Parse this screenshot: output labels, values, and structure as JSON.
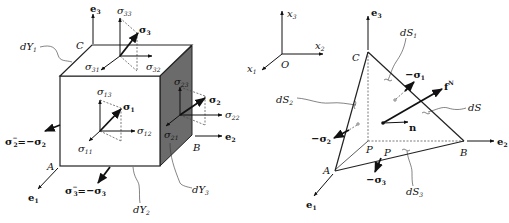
{
  "left_figure": {
    "title": "Stress element cube",
    "vertices": {
      "C": "C",
      "A": "A",
      "B": "B"
    },
    "basis": {
      "e3": "e",
      "e3_sub": "3",
      "e1": "e",
      "e1_sub": "1",
      "e2": "e",
      "e2_sub": "2"
    },
    "surfaces": {
      "dY1": "dY",
      "dY1_sub": "1",
      "dY2": "dY",
      "dY2_sub": "2",
      "dY3": "dY",
      "dY3_sub": "3"
    },
    "top_face": {
      "sigma33": "σ",
      "sigma33_sub": "33",
      "sigma31": "σ",
      "sigma31_sub": "31",
      "sigma32": "σ",
      "sigma32_sub": "32",
      "vec": "σ",
      "vec_sub": "3"
    },
    "front_face": {
      "sigma13": "σ",
      "sigma13_sub": "13",
      "sigma11": "σ",
      "sigma11_sub": "11",
      "sigma12": "σ",
      "sigma12_sub": "12",
      "vec": "σ",
      "vec_sub": "1"
    },
    "side_face": {
      "sigma23": "σ",
      "sigma23_sub": "23",
      "sigma21": "σ",
      "sigma21_sub": "21",
      "sigma22": "σ",
      "sigma22_sub": "22",
      "vec": "σ",
      "vec_sub": "2"
    },
    "neg_labels": {
      "sigma2_minus": "σ",
      "sigma2_minus_sub": "2",
      "sigma2_minus_sup": "−",
      "sigma2_eq": "=−σ",
      "sigma2_eq_sub": "2",
      "sigma3_minus": "σ",
      "sigma3_minus_sub": "3",
      "sigma3_minus_sup": "−",
      "sigma3_eq": "=−σ",
      "sigma3_eq_sub": "3"
    }
  },
  "right_figure": {
    "title": "Cauchy tetrahedron",
    "axes": {
      "x3": "x",
      "x3_sub": "3",
      "x2": "x",
      "x2_sub": "2",
      "x1": "x",
      "x1_sub": "1",
      "origin": "O"
    },
    "vertices": {
      "C": "C",
      "A": "A",
      "B": "B",
      "P": "P",
      "P2": "P"
    },
    "basis": {
      "e3": "e",
      "e3_sub": "3",
      "e1": "e",
      "e1_sub": "1",
      "e2": "e",
      "e2_sub": "2"
    },
    "surfaces": {
      "dS1": "dS",
      "dS1_sub": "1",
      "dS2": "dS",
      "dS2_sub": "2",
      "dS3": "dS",
      "dS3_sub": "3",
      "dS": "dS"
    },
    "vectors": {
      "neg_sigma1": "−σ",
      "neg_sigma1_sub": "1",
      "neg_sigma2": "−σ",
      "neg_sigma2_sub": "2",
      "neg_sigma3": "−σ",
      "neg_sigma3_sub": "3",
      "f": "f",
      "f_sup": "N",
      "n": "n"
    }
  }
}
